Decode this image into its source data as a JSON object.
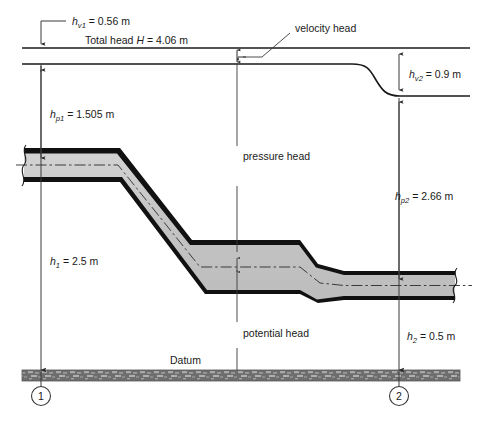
{
  "figure": {
    "labels": {
      "velocity_head_1": {
        "sym": "h",
        "sub": "v1",
        "text": " = 0.56 m"
      },
      "total_head": {
        "pre": "Total head ",
        "sym": "H",
        "text": " = 4.06 m"
      },
      "velocity_head_callout": "velocity head",
      "velocity_head_2": {
        "sym": "h",
        "sub": "v2",
        "text": " = 0.9 m"
      },
      "pressure_head_1": {
        "sym": "h",
        "sub": "p1",
        "text": " = 1.505 m"
      },
      "pressure_head_2": {
        "sym": "h",
        "sub": "p2",
        "text": " = 2.66 m"
      },
      "pressure_head_callout": "pressure head",
      "potential_head_callout": "potential head",
      "elevation_1": {
        "sym": "h",
        "sub": "1",
        "text": " = 2.5 m"
      },
      "elevation_2": {
        "sym": "h",
        "sub": "2",
        "text": " = 0.5 m"
      },
      "datum": "Datum",
      "station_1": "1",
      "station_2": "2"
    },
    "colors": {
      "line": "#1a1a1a",
      "pipe_wall": "#111111",
      "pipe_fill": "#c8c8c8",
      "datum_fill": "#6e6e6e",
      "datum_hatch": "#9b9b9b",
      "dimension_line": "#3a3a3a",
      "background": "#ffffff"
    },
    "values": {
      "total_head_m": 4.06,
      "velocity_head_1_m": 0.56,
      "velocity_head_2_m": 0.9,
      "pressure_head_1_m": 1.505,
      "pressure_head_2_m": 2.66,
      "elevation_1_m": 2.5,
      "elevation_2_m": 0.5
    }
  }
}
